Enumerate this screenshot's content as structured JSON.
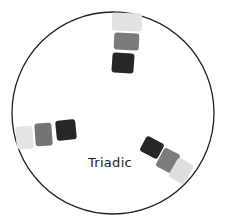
{
  "diagram": {
    "label": "Triadic",
    "circle": {
      "cx": 113,
      "cy": 113,
      "r": 101,
      "stroke": "#222222"
    },
    "groups": [
      {
        "name": "top",
        "swatches": [
          {
            "shade": "light",
            "color": "#e2e2e2",
            "x": 112,
            "y": 13,
            "w": 30,
            "h": 18,
            "rot": 2
          },
          {
            "shade": "mid",
            "color": "#7a7a7a",
            "x": 114,
            "y": 33,
            "w": 25,
            "h": 17,
            "rot": 3
          },
          {
            "shade": "dark",
            "color": "#262626",
            "x": 112,
            "y": 53,
            "w": 22,
            "h": 20,
            "rot": 4
          }
        ]
      },
      {
        "name": "left",
        "swatches": [
          {
            "shade": "light",
            "color": "#e4e4e4",
            "x": 16,
            "y": 126,
            "w": 17,
            "h": 23,
            "rot": -4
          },
          {
            "shade": "mid",
            "color": "#747474",
            "x": 35,
            "y": 123,
            "w": 17,
            "h": 23,
            "rot": -4
          },
          {
            "shade": "dark",
            "color": "#262626",
            "x": 56,
            "y": 120,
            "w": 20,
            "h": 20,
            "rot": -6
          }
        ]
      },
      {
        "name": "right",
        "swatches": [
          {
            "shade": "dark",
            "color": "#262626",
            "x": 142,
            "y": 139,
            "w": 20,
            "h": 17,
            "rot": 28
          },
          {
            "shade": "mid",
            "color": "#7c7c7c",
            "x": 159,
            "y": 150,
            "w": 18,
            "h": 21,
            "rot": 28
          },
          {
            "shade": "light",
            "color": "#dedede",
            "x": 172,
            "y": 160,
            "w": 18,
            "h": 22,
            "rot": 30
          }
        ]
      }
    ]
  }
}
